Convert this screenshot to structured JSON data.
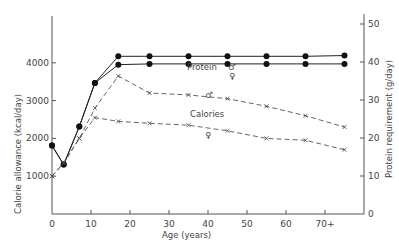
{
  "chart_data": {
    "type": "line",
    "title": "",
    "xlabel": "Age (years)",
    "ylabel_left": "Calorie allowance (kcal/day)",
    "ylabel_right": "Protein requirement (g/day)",
    "x_ticks": [
      "0",
      "10",
      "20",
      "30",
      "40",
      "50",
      "60",
      "70+"
    ],
    "y_left_ticks": [
      "1000",
      "2000",
      "3000",
      "4000"
    ],
    "y_right_ticks": [
      "0",
      "10",
      "20",
      "30",
      "40",
      "50"
    ],
    "xlim": [
      0,
      80
    ],
    "ylim_left": [
      0,
      5600
    ],
    "ylim_right": [
      0,
      52
    ],
    "grid": false,
    "annotations": [
      "Protein",
      "Calories",
      "♂",
      "♀",
      "♂",
      "♀"
    ],
    "series": [
      {
        "name": "Protein ♂",
        "axis": "right",
        "style": "solid-dots",
        "x": [
          0,
          3,
          7,
          11,
          17,
          25,
          35,
          45,
          55,
          65,
          75
        ],
        "values": [
          18,
          13,
          23,
          34.5,
          41.5,
          41.5,
          41.5,
          41.5,
          41.5,
          41.5,
          41.7
        ]
      },
      {
        "name": "Protein ♀",
        "axis": "right",
        "style": "solid-dots",
        "x": [
          0,
          3,
          7,
          11,
          17,
          25,
          35,
          45,
          55,
          65,
          75
        ],
        "values": [
          18,
          13,
          23,
          34.5,
          39.3,
          39.5,
          39.5,
          39.5,
          39.5,
          39.5,
          39.5
        ]
      },
      {
        "name": "Calories ♂",
        "axis": "left",
        "style": "dashed-x",
        "x": [
          0,
          3,
          7,
          11,
          17,
          25,
          35,
          45,
          55,
          65,
          75
        ],
        "values": [
          1000,
          1350,
          2000,
          2800,
          3650,
          3200,
          3150,
          3050,
          2850,
          2600,
          2300
        ]
      },
      {
        "name": "Calories ♀",
        "axis": "left",
        "style": "dashed-x",
        "x": [
          0,
          3,
          7,
          11,
          17,
          25,
          35,
          45,
          55,
          65,
          75
        ],
        "values": [
          1000,
          1350,
          2000,
          2550,
          2450,
          2400,
          2350,
          2200,
          2000,
          1950,
          1700
        ]
      }
    ]
  },
  "labels": {
    "protein": "Protein",
    "calories": "Calories",
    "male": "♂",
    "female": "♀",
    "xlabel": "Age (years)",
    "ylabel_left": "Calorie allowance (kcal/day)",
    "ylabel_right": "Protein requirement (g/day)"
  }
}
